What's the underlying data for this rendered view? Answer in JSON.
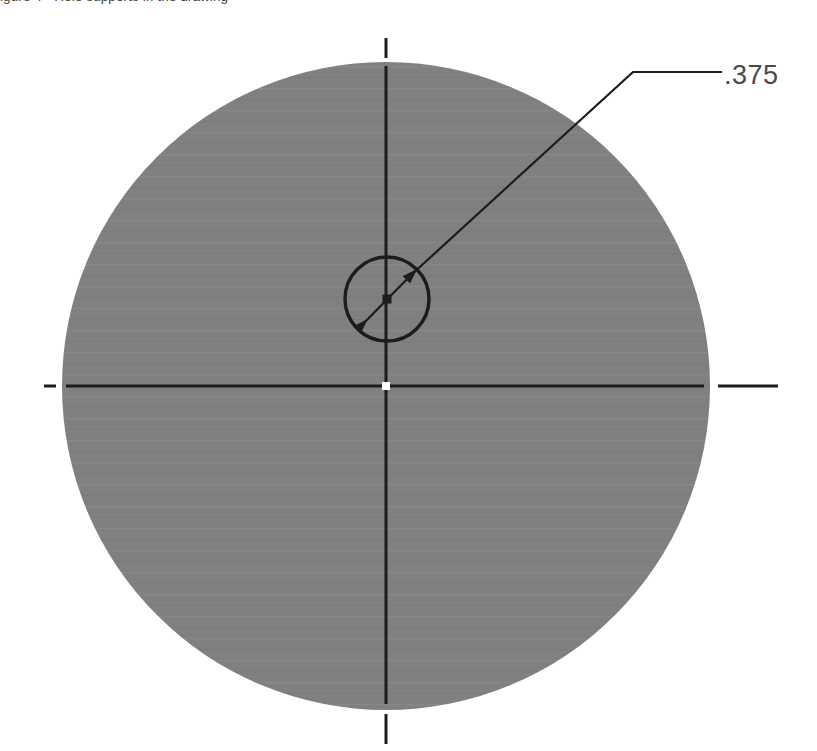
{
  "document": {
    "type": "cad-technical-drawing",
    "view_name": "top-view-circular-plate",
    "background_color": "#ffffff"
  },
  "top_caption": {
    "text": "igure 4 - Hole supports in the drawing",
    "visible": "partially-clipped-above-viewport",
    "color": "#3a3a3a"
  },
  "part_outline": {
    "shape": "circle",
    "center_x": 386,
    "center_y": 386,
    "radius": 324,
    "fill_color": "#808080",
    "stroke_color": "none"
  },
  "hole": {
    "shape": "circle",
    "center_x": 387,
    "center_y": 299,
    "radius": 42,
    "fill_color": "none",
    "stroke_color": "#1c1c1c",
    "stroke_width": 3
  },
  "center_mark": {
    "shape": "square-dot",
    "x": 387,
    "y": 299,
    "size": 9,
    "color": "#1c1c1c"
  },
  "origin_mark": {
    "shape": "square-dot",
    "x": 386,
    "y": 386,
    "size": 8,
    "color": "#ffffff"
  },
  "centerlines": {
    "color": "#1c1c1c",
    "stroke_width": 3,
    "horizontal": {
      "left_tick": {
        "x1": 44,
        "x2": 56,
        "y": 386
      },
      "main": {
        "x1": 66,
        "x2": 704,
        "y": 386
      },
      "right_extension": {
        "x1": 718,
        "x2": 778,
        "y": 386
      }
    },
    "vertical": {
      "top_extension": {
        "y1": 38,
        "y2": 58,
        "x": 386
      },
      "main": {
        "y1": 66,
        "y2": 704,
        "x": 386
      },
      "bottom_extension": {
        "y1": 714,
        "y2": 744,
        "x": 386
      }
    }
  },
  "diameter_dimension": {
    "label": ".375",
    "label_x": 724,
    "label_y": 60,
    "label_color": "#4a4a4a",
    "dimension_line": {
      "x1": 358,
      "y1": 329,
      "x2": 417,
      "y2": 269,
      "color": "#1c1c1c",
      "arrowheads": "both-ends"
    },
    "leader": {
      "points": [
        {
          "x": 410,
          "y": 276
        },
        {
          "x": 633,
          "y": 72
        },
        {
          "x": 722,
          "y": 72
        }
      ],
      "color": "#1c1c1c",
      "stroke_width": 2
    }
  },
  "fill_banding": {
    "description": "subtle horizontal compression banding in gray fill",
    "band_color_light": "#8a8a8a",
    "band_color_dark": "#797979"
  }
}
